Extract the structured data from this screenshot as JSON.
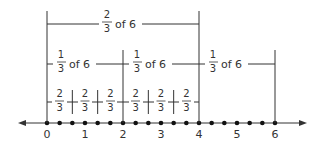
{
  "diagram": {
    "title": "",
    "number_line": {
      "min": 0,
      "max": 6,
      "tick_labels": [
        "0",
        "1",
        "2",
        "3",
        "4",
        "5",
        "6"
      ],
      "dot_step": "1/3",
      "arrows": "both"
    },
    "top_bracket": {
      "num": "2",
      "den": "3",
      "text": "of 6",
      "from": 0,
      "to": 4
    },
    "middle_brackets": [
      {
        "num": "1",
        "den": "3",
        "text": "of 6",
        "from": 0,
        "to": 2
      },
      {
        "num": "1",
        "den": "3",
        "text": "of 6",
        "from": 2,
        "to": 4
      },
      {
        "num": "1",
        "den": "3",
        "text": "of 6",
        "from": 4,
        "to": 6
      }
    ],
    "small_segments": [
      {
        "num": "2",
        "den": "3"
      },
      {
        "num": "2",
        "den": "3"
      },
      {
        "num": "2",
        "den": "3"
      },
      {
        "num": "2",
        "den": "3"
      },
      {
        "num": "2",
        "den": "3"
      },
      {
        "num": "2",
        "den": "3"
      }
    ],
    "colors": {
      "line": "#333333",
      "background": "#ffffff"
    }
  }
}
